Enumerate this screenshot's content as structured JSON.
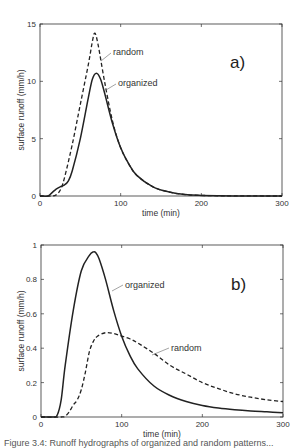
{
  "chart_data": [
    {
      "type": "line",
      "panel_label": "a)",
      "xlabel": "time (min)",
      "ylabel": "surface runoff (mm/h)",
      "xlim": [
        0,
        300
      ],
      "ylim": [
        0,
        15
      ],
      "xticks": [
        0,
        100,
        200,
        300
      ],
      "yticks": [
        0,
        5,
        10,
        15
      ],
      "grid": false,
      "series": [
        {
          "name": "random",
          "style": "dashed",
          "x": [
            0,
            15,
            20,
            25,
            30,
            40,
            50,
            60,
            65,
            68,
            72,
            80,
            90,
            100,
            110,
            120,
            140,
            160,
            180,
            200,
            240,
            300
          ],
          "y": [
            0,
            0,
            0.1,
            0.5,
            1.5,
            4.5,
            8,
            11.5,
            13.5,
            14.2,
            13.2,
            10,
            6.5,
            4.2,
            2.8,
            1.8,
            0.8,
            0.35,
            0.12,
            0.05,
            0.01,
            0
          ]
        },
        {
          "name": "organized",
          "style": "solid",
          "x": [
            0,
            10,
            15,
            20,
            25,
            30,
            35,
            40,
            50,
            60,
            65,
            70,
            75,
            80,
            90,
            100,
            110,
            120,
            140,
            160,
            180,
            200,
            240,
            300
          ],
          "y": [
            0,
            0,
            0.3,
            0.6,
            0.8,
            0.95,
            1.3,
            2.2,
            5,
            8.6,
            10.2,
            10.7,
            10.2,
            9,
            6.3,
            4.2,
            2.8,
            1.8,
            0.8,
            0.35,
            0.12,
            0.05,
            0.01,
            0
          ]
        }
      ],
      "annotations": [
        "random",
        "organized"
      ]
    },
    {
      "type": "line",
      "panel_label": "b)",
      "xlabel": "time (min)",
      "ylabel": "surface runoff (mm/h)",
      "xlim": [
        0,
        300
      ],
      "ylim": [
        0,
        1
      ],
      "xticks": [
        0,
        100,
        200,
        300
      ],
      "yticks": [
        0,
        0.2,
        0.4,
        0.6,
        0.8,
        1
      ],
      "grid": false,
      "series": [
        {
          "name": "organized",
          "style": "solid",
          "x": [
            0,
            15,
            20,
            25,
            30,
            40,
            50,
            60,
            65,
            68,
            72,
            80,
            90,
            100,
            110,
            120,
            140,
            160,
            180,
            200,
            220,
            240,
            260,
            280,
            300
          ],
          "y": [
            0,
            0,
            0.01,
            0.1,
            0.3,
            0.62,
            0.85,
            0.94,
            0.96,
            0.955,
            0.92,
            0.8,
            0.62,
            0.47,
            0.36,
            0.28,
            0.18,
            0.125,
            0.09,
            0.067,
            0.052,
            0.042,
            0.035,
            0.03,
            0.025
          ]
        },
        {
          "name": "random",
          "style": "dashed",
          "x": [
            0,
            25,
            30,
            35,
            40,
            45,
            50,
            55,
            60,
            65,
            70,
            80,
            90,
            100,
            110,
            120,
            140,
            160,
            180,
            200,
            220,
            240,
            260,
            280,
            300
          ],
          "y": [
            0,
            0,
            0.005,
            0.03,
            0.07,
            0.1,
            0.16,
            0.26,
            0.38,
            0.44,
            0.47,
            0.49,
            0.485,
            0.47,
            0.455,
            0.43,
            0.37,
            0.3,
            0.25,
            0.2,
            0.165,
            0.135,
            0.115,
            0.1,
            0.09
          ]
        }
      ],
      "annotations": [
        "organized",
        "random"
      ]
    }
  ],
  "caption": "Figure 3.4: Runoff hydrographs of organized and random patterns..."
}
